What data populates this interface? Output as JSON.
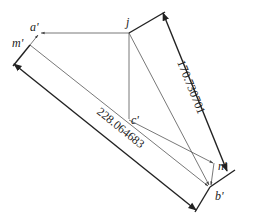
{
  "diagram": {
    "type": "geometry-projection",
    "points": {
      "j": {
        "label": "j",
        "x": 129,
        "y": 33,
        "lx": 126,
        "ly": 26
      },
      "a": {
        "label": "a'",
        "x": 40,
        "y": 33,
        "lx": 27,
        "ly": 29
      },
      "m": {
        "label": "m'",
        "x": 30,
        "y": 45,
        "lx": 11,
        "ly": 48
      },
      "c": {
        "label": "c'",
        "x": 129,
        "y": 120,
        "lx": 132,
        "ly": 125
      },
      "n": {
        "label": "n'",
        "x": 214,
        "y": 163,
        "lx": 217,
        "ly": 170
      },
      "b": {
        "label": "b'",
        "x": 210,
        "y": 187,
        "lx": 215,
        "ly": 200
      }
    },
    "dimensions": [
      {
        "id": "dim-jb",
        "value": "170.730701",
        "from": [
          163,
          13
        ],
        "to": [
          227,
          171
        ]
      },
      {
        "id": "dim-mb",
        "value": "228.064683",
        "from": [
          14,
          64
        ],
        "to": [
          196,
          210
        ]
      }
    ],
    "colors": {
      "line": "#555555",
      "dimension": "#222222",
      "background": "#ffffff"
    }
  }
}
